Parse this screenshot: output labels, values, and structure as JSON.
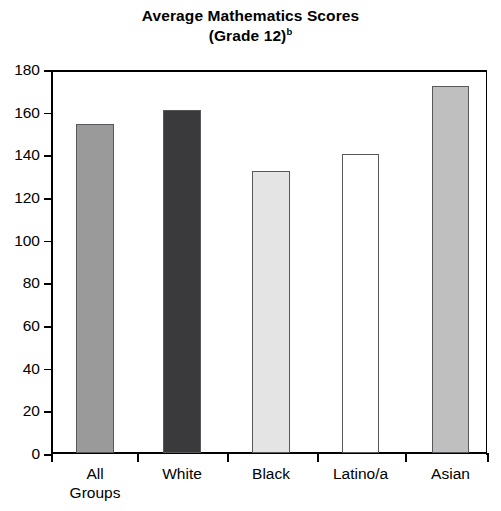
{
  "chart_data": {
    "type": "bar",
    "title": "Average Mathematics Scores",
    "subtitle": "(Grade 12)",
    "subtitle_superscript": "b",
    "xlabel": "",
    "ylabel": "",
    "categories": [
      "All Groups",
      "White",
      "Black",
      "Latino/a",
      "Asian"
    ],
    "values": [
      154,
      161,
      132,
      140,
      172
    ],
    "ylim": [
      0,
      180
    ],
    "ytick_step": 20,
    "yticks": [
      0,
      20,
      40,
      60,
      80,
      100,
      120,
      140,
      160,
      180
    ],
    "ytick_labels": [
      "0",
      "20",
      "40",
      "60",
      "80",
      "100",
      "120",
      "140",
      "160",
      "180"
    ],
    "grid": false,
    "legend": false,
    "bar_colors": [
      "#9a9a9a",
      "#3a3a3c",
      "#e4e4e4",
      "#ffffff",
      "#bfbfbf"
    ],
    "bar_border_color": "#58585a",
    "axis_color": "#000000",
    "background_color": "#ffffff"
  },
  "axis": {
    "y_title": "",
    "x_title": ""
  },
  "category_labels": [
    {
      "line1": "All",
      "line2": "Groups"
    },
    {
      "line1": "White",
      "line2": ""
    },
    {
      "line1": "Black",
      "line2": ""
    },
    {
      "line1": "Latino/a",
      "line2": ""
    },
    {
      "line1": "Asian",
      "line2": ""
    }
  ]
}
